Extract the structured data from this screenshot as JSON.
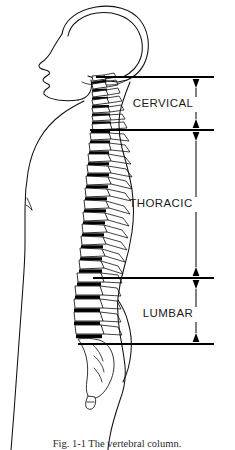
{
  "figure": {
    "orientation": "left-facing profile",
    "background_color": "#ffffff",
    "ink_color": "#111111",
    "disc_color": "#000000"
  },
  "regions": [
    {
      "id": "cervical",
      "label": "CERVICAL",
      "label_x": 163,
      "label_y": 107,
      "top_y": 77,
      "bottom_y": 130,
      "vertebra_count": 7
    },
    {
      "id": "thoracic",
      "label": "THORACIC",
      "label_x": 161,
      "label_y": 207,
      "top_y": 130,
      "bottom_y": 278,
      "vertebra_count": 12
    },
    {
      "id": "lumbar",
      "label": "LUMBAR",
      "label_x": 168,
      "label_y": 317,
      "top_y": 278,
      "bottom_y": 344,
      "vertebra_count": 5
    }
  ],
  "leaders": {
    "spine_x": 196,
    "rules": [
      {
        "id": "rule-cervical-top",
        "y": 77,
        "x1": 96,
        "x2": 214,
        "arrow": "down"
      },
      {
        "id": "rule-cervical-thoracic",
        "y": 130,
        "x1": 90,
        "x2": 214,
        "arrow": "both"
      },
      {
        "id": "rule-thoracic-lumbar",
        "y": 278,
        "x1": 93,
        "x2": 214,
        "arrow": "both"
      },
      {
        "id": "rule-lumbar-bottom",
        "y": 344,
        "x1": 78,
        "x2": 214,
        "arrow": "up"
      }
    ]
  },
  "caption": {
    "text": "Fig. 1-1  The vertebral column.",
    "x": 117,
    "y": 447,
    "truncated": true
  }
}
